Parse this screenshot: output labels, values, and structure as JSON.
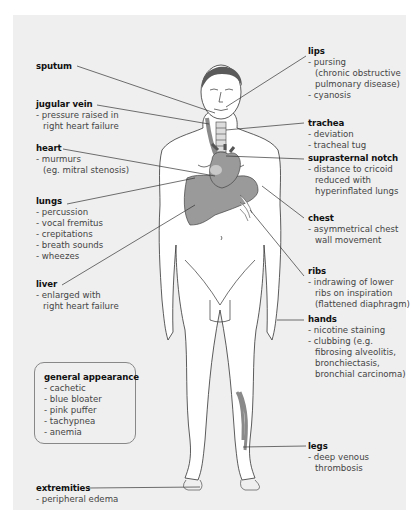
{
  "diagram": {
    "colors": {
      "panel": "#efefef",
      "organ_fill": "#9a9a9a",
      "hair": "#5a5a5a",
      "outline": "#333333"
    },
    "labels": {
      "sputum": {
        "title": "sputum",
        "lines": []
      },
      "jugular_vein": {
        "title": "jugular vein",
        "lines": [
          "- pressure raised in",
          "right heart failure"
        ]
      },
      "heart": {
        "title": "heart",
        "lines": [
          "- murmurs",
          "(eg. mitral stenosis)"
        ]
      },
      "lungs": {
        "title": "lungs",
        "lines": [
          "- percussion",
          "- vocal fremitus",
          "- crepitations",
          "- breath sounds",
          "- wheezes"
        ]
      },
      "liver": {
        "title": "liver",
        "lines": [
          "- enlarged with",
          "right heart failure"
        ]
      },
      "general_appearance": {
        "title": "general appearance",
        "lines": [
          "- cachetic",
          "- blue bloater",
          "- pink puffer",
          "- tachypnea",
          "- anemia"
        ]
      },
      "extremities": {
        "title": "extremities",
        "lines": [
          "- peripheral edema"
        ]
      },
      "lips": {
        "title": "lips",
        "lines": [
          "- pursing",
          "(chronic obstructive",
          "pulmonary disease)",
          "- cyanosis"
        ]
      },
      "trachea": {
        "title": "trachea",
        "lines": [
          "- deviation",
          "- tracheal tug"
        ]
      },
      "suprasternal_notch": {
        "title": "suprasternal notch",
        "lines": [
          "- distance to cricoid",
          "reduced with",
          "hyperinflated lungs"
        ]
      },
      "chest": {
        "title": "chest",
        "lines": [
          "- asymmetrical chest",
          "wall movement"
        ]
      },
      "ribs": {
        "title": "ribs",
        "lines": [
          "- indrawing of lower",
          "ribs on inspiration",
          "(flattened diaphragm)"
        ]
      },
      "hands": {
        "title": "hands",
        "lines": [
          "- nicotine staining",
          "- clubbing (e.g.",
          "fibrosing alveolitis,",
          "bronchiectasis,",
          "bronchial carcinoma)"
        ]
      },
      "legs": {
        "title": "legs",
        "lines": [
          "- deep venous",
          "thrombosis"
        ]
      }
    }
  }
}
